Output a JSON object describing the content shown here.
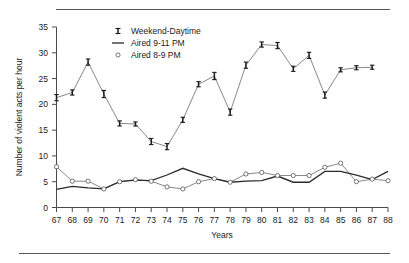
{
  "chart_data": {
    "type": "line",
    "title": "",
    "xlabel": "Years",
    "ylabel": "Number of violent acts per hour",
    "xlim": [
      67,
      88
    ],
    "ylim": [
      0,
      35
    ],
    "grid": false,
    "legend_position": "top-left-inside",
    "x": [
      67,
      68,
      69,
      70,
      71,
      72,
      73,
      74,
      75,
      76,
      77,
      78,
      79,
      80,
      81,
      82,
      83,
      84,
      85,
      86,
      87,
      88
    ],
    "xtick_labels": [
      "67",
      "68",
      "69",
      "70",
      "71",
      "72",
      "73",
      "74",
      "75",
      "76",
      "77",
      "78",
      "79",
      "80",
      "81",
      "82",
      "83",
      "84",
      "85",
      "86",
      "87",
      "88"
    ],
    "ytick_labels": [
      "0",
      "5",
      "10",
      "15",
      "20",
      "25",
      "30",
      "35"
    ],
    "yticks": [
      0,
      5,
      10,
      15,
      20,
      25,
      30,
      35
    ],
    "series": [
      {
        "name": "Weekend-Daytime",
        "marker": "error-bar",
        "values": [
          21.3,
          22.3,
          28.2,
          22.0,
          16.3,
          16.2,
          12.8,
          11.8,
          17.0,
          23.9,
          25.5,
          18.5,
          27.6,
          31.6,
          31.4,
          26.9,
          29.5,
          21.8,
          26.7,
          27.1,
          27.2,
          null
        ],
        "errors": [
          0.6,
          0.5,
          0.6,
          0.7,
          0.5,
          0.4,
          0.6,
          0.6,
          0.5,
          0.5,
          0.7,
          0.6,
          0.6,
          0.5,
          0.6,
          0.5,
          0.6,
          0.6,
          0.4,
          0.4,
          0.4,
          null
        ]
      },
      {
        "name": "Aired 9-11 PM",
        "marker": "line",
        "values": [
          3.5,
          4.1,
          3.8,
          3.6,
          5.0,
          5.3,
          5.2,
          6.3,
          7.6,
          6.5,
          5.6,
          4.9,
          5.1,
          5.2,
          6.1,
          4.9,
          4.9,
          7.0,
          7.0,
          6.3,
          5.4,
          7.0
        ]
      },
      {
        "name": "Aired 8-9 PM",
        "marker": "open-circle",
        "values": [
          7.9,
          5.1,
          5.1,
          3.6,
          5.0,
          5.4,
          5.1,
          4.0,
          3.6,
          5.0,
          5.6,
          4.9,
          6.5,
          6.8,
          6.2,
          6.2,
          6.2,
          7.8,
          8.6,
          5.0,
          5.5,
          5.2
        ]
      }
    ],
    "legend_entries": [
      {
        "label": "Weekend-Daytime",
        "marker": "error-bar"
      },
      {
        "label": "Aired 9-11 PM",
        "marker": "line"
      },
      {
        "label": "Aired 8-9 PM",
        "marker": "open-circle"
      }
    ],
    "colors": {
      "weekend_daytime_line": "#7a7a7a",
      "weekend_daytime_marker": "#1a1a1a",
      "aired_9_11": "#2b2b2b",
      "aired_8_9_line": "#7a7a7a",
      "aired_8_9_marker": "#555555",
      "axis": "#4a4a4a",
      "rule": "#555555",
      "background": "#ffffff"
    }
  }
}
